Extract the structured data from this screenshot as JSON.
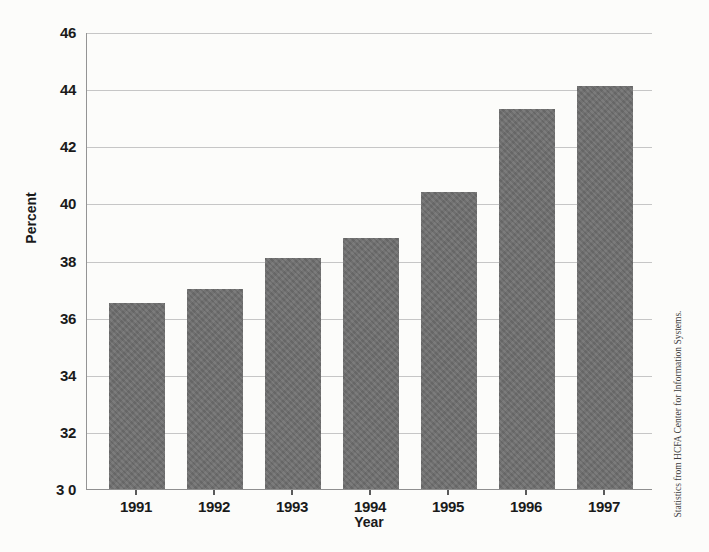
{
  "chart_data": {
    "type": "bar",
    "title": "",
    "categories": [
      "1991",
      "1992",
      "1993",
      "1994",
      "1995",
      "1996",
      "1997"
    ],
    "values": [
      36.5,
      37.0,
      38.1,
      38.8,
      40.4,
      43.3,
      44.1
    ],
    "xlabel": "Year",
    "ylabel": "Percent",
    "ylim": [
      30,
      46
    ],
    "ytick_values": [
      46,
      44,
      42,
      40,
      38,
      36,
      34,
      32,
      30
    ],
    "ytick_labels": [
      "46",
      "44",
      "42",
      "40",
      "38",
      "36",
      "34",
      "32",
      "3 0"
    ],
    "grid": true,
    "legend": "none",
    "bar_color": "#6f6f6f",
    "gridline_color": "#c6c6c6",
    "axis_color": "#949494",
    "text_color": "#1a1a1a"
  },
  "caption": "Statistics from HCFA Center for Information Systems."
}
